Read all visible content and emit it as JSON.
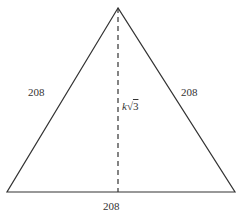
{
  "diagram": {
    "type": "equilateral-triangle-with-altitude",
    "stroke_color": "#333333",
    "vertices": {
      "apex": [
        118,
        8
      ],
      "base_left": [
        7,
        192
      ],
      "base_right": [
        235,
        192
      ]
    },
    "altitude": {
      "from": [
        118,
        8
      ],
      "to": [
        118,
        192
      ],
      "style": "dashed"
    },
    "labels": {
      "left_side": "208",
      "right_side": "208",
      "base": "208",
      "altitude_var": "k",
      "altitude_root": "√",
      "altitude_radicand": "3"
    }
  }
}
